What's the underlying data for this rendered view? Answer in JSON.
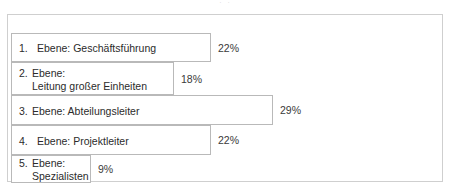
{
  "artifact": {
    "top_fragment": "··"
  },
  "frame": {
    "border_color": "#cfcfcf",
    "background": "#ffffff"
  },
  "chart_data": {
    "type": "bar",
    "orientation": "horizontal",
    "title": "",
    "subtitle": "",
    "xlabel": "",
    "ylabel": "",
    "grid": false,
    "legend": "none",
    "xlim": [
      0,
      44
    ],
    "value_suffix": "%",
    "bar_fill": "#ffffff",
    "bar_border": "#b9b9b9",
    "categories": [
      "1. Ebene: Geschäftsführung",
      "2. Ebene: Leitung großer Einheiten",
      "3. Ebene: Abteilungsleiter",
      "4. Ebene: Projektleiter",
      "5. Ebene: Spezialisten"
    ],
    "values": [
      22,
      18,
      29,
      22,
      9
    ],
    "value_labels": [
      "22%",
      "18%",
      "29%",
      "22%",
      "9%"
    ]
  },
  "bars": [
    {
      "index": "1.",
      "lines": [
        "Ebene: Geschäftsführung"
      ],
      "value_label": "22%",
      "value": 22,
      "width_px": 200,
      "top_px": 9,
      "height_px": 29,
      "wide_num": true
    },
    {
      "index": "2.",
      "lines": [
        "Ebene:",
        "Leitung großer Einheiten"
      ],
      "value_label": "18%",
      "value": 18,
      "width_px": 163,
      "top_px": 38,
      "height_px": 33,
      "wide_num": false
    },
    {
      "index": "3.",
      "lines": [
        "Ebene: Abteilungsleiter"
      ],
      "value_label": "29%",
      "value": 29,
      "width_px": 262,
      "top_px": 71,
      "height_px": 30,
      "wide_num": false
    },
    {
      "index": "4.",
      "lines": [
        "Ebene: Projektleiter"
      ],
      "value_label": "22%",
      "value": 22,
      "width_px": 200,
      "top_px": 101,
      "height_px": 30,
      "wide_num": true
    },
    {
      "index": "5.",
      "lines": [
        "Ebene:",
        "Spezialisten"
      ],
      "value_label": "9%",
      "value": 9,
      "width_px": 80,
      "top_px": 131,
      "height_px": 28,
      "wide_num": false
    }
  ]
}
